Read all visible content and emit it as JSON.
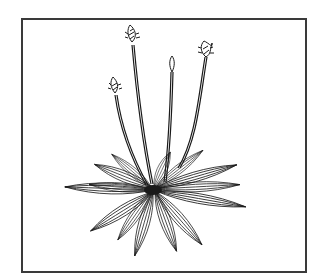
{
  "illustration": {
    "subject": "plantain plant line drawing",
    "frame": {
      "border_color": "#3a3a3a",
      "background": "#ffffff"
    },
    "ink_color": "#1a1a1a",
    "flower_heads": [
      {
        "id": "left-low",
        "x": 115,
        "y": 93
      },
      {
        "id": "tall-left",
        "x": 131,
        "y": 42
      },
      {
        "id": "center",
        "x": 171,
        "y": 70
      },
      {
        "id": "right",
        "x": 205,
        "y": 53
      }
    ],
    "rosette_center": {
      "x": 153,
      "y": 190
    },
    "leaf_count": 14
  }
}
